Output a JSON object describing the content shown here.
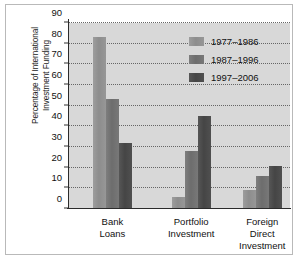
{
  "chart_data": {
    "type": "bar",
    "title": "",
    "subtitle": "",
    "xlabel": "",
    "ylabel": "Percentage of International Investment Funding",
    "ylabel_lines": [
      "Percentage of International",
      "Investment Funding"
    ],
    "ylim": [
      0,
      90
    ],
    "yticks": [
      0,
      10,
      20,
      30,
      40,
      50,
      60,
      70,
      80,
      90
    ],
    "ytick_labels": [
      "0",
      "10",
      "20",
      "30",
      "40",
      "50",
      "60",
      "70",
      "80",
      "90"
    ],
    "grid": true,
    "grid_style": "dotted-horizontal",
    "legend_position": "top-right-inside",
    "categories": [
      "Bank Loans",
      "Portfolio Investment",
      "Foreign Direct Investment"
    ],
    "category_lines": [
      [
        "Bank",
        "Loans"
      ],
      [
        "Portfolio",
        "Investment"
      ],
      [
        "Foreign",
        "Direct",
        "Investment"
      ]
    ],
    "series": [
      {
        "name": "1977–1986",
        "color": "#8d8d8d",
        "values": [
          83,
          6,
          9
        ]
      },
      {
        "name": "1987–1996",
        "color": "#6d6d6d",
        "values": [
          53,
          28,
          16
        ]
      },
      {
        "name": "1997–2006",
        "color": "#454545",
        "values": [
          32,
          45,
          21
        ]
      }
    ]
  },
  "figure": {
    "background_color": "#ffffff",
    "plot_background_color": "#d8d8d8",
    "frame_color": "#b9b9b9",
    "axis_color": "#2b2b2b",
    "grid_color": "#666666",
    "text_color": "#111111"
  }
}
